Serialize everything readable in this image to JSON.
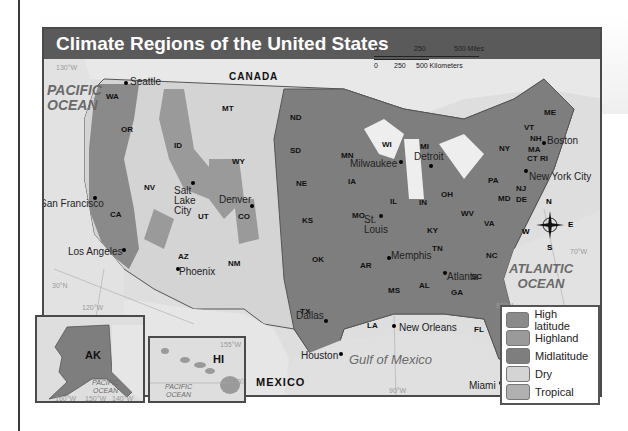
{
  "title": "Climate Regions of the United States",
  "colors": {
    "title_bar": "#5a5a5a",
    "high_latitude": "#8a8a8a",
    "highland": "#9a9a9a",
    "midlatitude": "#7e7e7e",
    "dry": "#d4d4d4",
    "tropical": "#b0b0b0",
    "water": "#e0e0e0"
  },
  "countries": {
    "canada": "CANADA",
    "mexico": "MEXICO"
  },
  "oceans": {
    "pacific": [
      "PACIFIC",
      "OCEAN"
    ],
    "atlantic": [
      "ATLANTIC",
      "OCEAN"
    ],
    "gulf": "Gulf of Mexico",
    "pacific_ak": [
      "PACIFIC",
      "OCEAN"
    ],
    "pacific_hi": [
      "PACIFIC",
      "OCEAN"
    ]
  },
  "scale_bar": {
    "miles": [
      "0",
      "250",
      "500 Miles"
    ],
    "kilometers": [
      "0",
      "250",
      "500 Kilometers"
    ]
  },
  "compass": {
    "n": "N",
    "s": "S",
    "e": "E",
    "w": "W"
  },
  "states": [
    "WA",
    "OR",
    "CA",
    "NV",
    "ID",
    "MT",
    "WY",
    "UT",
    "CO",
    "AZ",
    "NM",
    "ND",
    "SD",
    "NE",
    "KS",
    "OK",
    "TX",
    "MN",
    "IA",
    "MO",
    "AR",
    "LA",
    "WI",
    "IL",
    "MS",
    "MI",
    "IN",
    "KY",
    "TN",
    "AL",
    "OH",
    "WV",
    "GA",
    "FL",
    "SC",
    "NC",
    "VA",
    "PA",
    "NY",
    "MD",
    "DE",
    "NJ",
    "CT",
    "RI",
    "MA",
    "VT",
    "NH",
    "ME",
    "AK",
    "HI"
  ],
  "cities": [
    "Seattle",
    "San Francisco",
    "Los Angeles",
    "Salt Lake City",
    "Denver",
    "Phoenix",
    "Dallas",
    "Houston",
    "St. Louis",
    "Milwaukee",
    "Detroit",
    "Memphis",
    "New Orleans",
    "Atlanta",
    "Miami",
    "New York City",
    "Boston"
  ],
  "grid_labels": [
    "130°W",
    "120°W",
    "30°N",
    "70°W",
    "80°W",
    "90°W",
    "160°W",
    "150°W",
    "140°W",
    "155°W",
    "20°N"
  ],
  "legend": {
    "items": [
      {
        "label": "High latitude",
        "color": "#8a8a8a"
      },
      {
        "label": "Highland",
        "color": "#9a9a9a"
      },
      {
        "label": "Midlatitude",
        "color": "#7e7e7e"
      },
      {
        "label": "Dry",
        "color": "#d4d4d4"
      },
      {
        "label": "Tropical",
        "color": "#b0b0b0"
      }
    ]
  }
}
